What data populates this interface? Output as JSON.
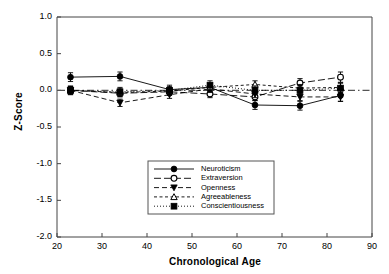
{
  "chart_data": {
    "type": "line",
    "title": "",
    "xlabel": "Chronological Age",
    "ylabel": "Z-Score",
    "xlim": [
      20,
      90
    ],
    "ylim": [
      -2.0,
      1.0
    ],
    "xticks": [
      20,
      30,
      40,
      50,
      60,
      70,
      80,
      90
    ],
    "xticklabels": [
      "20",
      "30",
      "40",
      "50",
      "60",
      "70",
      "80",
      "90"
    ],
    "yticks": [
      1.0,
      0.5,
      0.0,
      -0.5,
      -1.0,
      -1.5,
      -2.0
    ],
    "yticklabels": [
      "1.0",
      "0.5",
      "0.0",
      "-0.5",
      "-1.0",
      "-1.5",
      "-2.0"
    ],
    "grid": false,
    "legend_position": "lower-center",
    "reference_line": {
      "y": 0.0,
      "style": "dash-dot",
      "color": "#555555"
    },
    "x": [
      23,
      34,
      45,
      54,
      64,
      74,
      83
    ],
    "series": [
      {
        "name": "Neuroticism",
        "marker": "filled-circle",
        "line": "solid",
        "values": [
          0.18,
          0.19,
          0.01,
          0.04,
          -0.2,
          -0.21,
          -0.07
        ],
        "errors": [
          0.06,
          0.06,
          0.06,
          0.06,
          0.06,
          0.06,
          0.08
        ]
      },
      {
        "name": "Extraversion",
        "marker": "open-circle",
        "line": "long-dash",
        "values": [
          0.0,
          -0.04,
          -0.02,
          -0.05,
          -0.09,
          0.1,
          0.18
        ],
        "errors": [
          0.05,
          0.05,
          0.05,
          0.05,
          0.05,
          0.06,
          0.07
        ]
      },
      {
        "name": "Openness",
        "marker": "filled-triangle-down",
        "line": "dash",
        "values": [
          0.0,
          -0.17,
          -0.06,
          0.02,
          -0.05,
          -0.09,
          -0.09
        ],
        "errors": [
          0.05,
          0.05,
          0.05,
          0.05,
          0.05,
          0.05,
          0.06
        ]
      },
      {
        "name": "Agreeableness",
        "marker": "open-triangle-up",
        "line": "short-dash",
        "values": [
          0.0,
          -0.03,
          -0.01,
          0.04,
          0.08,
          0.03,
          0.04
        ],
        "errors": [
          0.05,
          0.05,
          0.05,
          0.05,
          0.05,
          0.05,
          0.06
        ]
      },
      {
        "name": "Conscientiousness",
        "marker": "filled-square",
        "line": "dotted",
        "values": [
          0.0,
          -0.02,
          0.0,
          0.07,
          0.0,
          0.0,
          0.03
        ],
        "errors": [
          0.06,
          0.06,
          0.05,
          0.06,
          0.06,
          0.06,
          0.07
        ]
      }
    ]
  },
  "axes": {
    "y_axis_title": "Z-Score",
    "x_axis_title": "Chronological Age"
  },
  "legend": {
    "items": [
      {
        "label": "Neuroticism"
      },
      {
        "label": "Extraversion"
      },
      {
        "label": "Openness"
      },
      {
        "label": "Agreeableness"
      },
      {
        "label": "Conscientiousness"
      }
    ]
  },
  "colors": {
    "axis": "#444444",
    "series": "#000000",
    "reference": "#666666",
    "background": "#ffffff"
  }
}
